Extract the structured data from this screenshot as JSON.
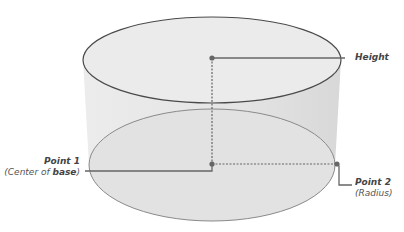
{
  "diagram": {
    "labels": {
      "height": "Height",
      "point1_title": "Point 1",
      "point1_sub_prefix": "(Center of ",
      "point1_sub_bold": "base",
      "point1_sub_suffix": ")",
      "point2_title": "Point 2",
      "point2_sub": "(Radius)"
    },
    "colors": {
      "body_fill": "#e6e6e6",
      "outline": "#555555",
      "lower_outline": "#888888",
      "leader": "#666666"
    }
  }
}
